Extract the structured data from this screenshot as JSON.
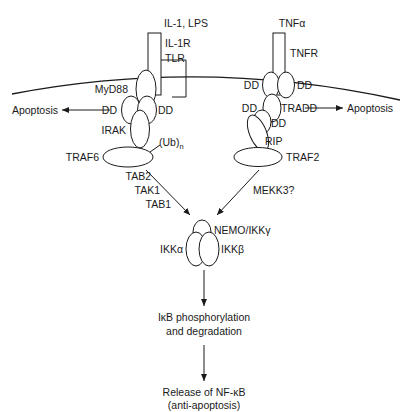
{
  "diagram": {
    "background_color": "#ffffff",
    "stroke_color": "#1a1a1a",
    "ligands": {
      "left": "IL-1, LPS",
      "right": "TNFα"
    },
    "receptors": {
      "left_line1": "IL-1R",
      "left_line2": "TLR",
      "right": "TNFR"
    },
    "left_branch": {
      "adaptor": "MyD88",
      "death_domain_left": "DD",
      "death_domain_right": "DD",
      "kinase": "IRAK",
      "traf": "TRAF6",
      "ubiquitin": "(Ub)",
      "ubiquitin_sub": "n",
      "outcome": "Apoptosis",
      "intermediates": [
        "TAB2",
        "TAK1",
        "TAB1"
      ]
    },
    "right_branch": {
      "death_domain_upper_left": "DD",
      "death_domain_upper_right": "DD",
      "death_domain_lower_left": "DD",
      "adaptor": "TRADD",
      "death_domain_rip": "DD",
      "kinase": "RIP",
      "traf": "TRAF2",
      "outcome": "Apoptosis",
      "intermediates": [
        "MEKK3?"
      ]
    },
    "ikk_complex": {
      "nemo": "NEMO/IKKγ",
      "alpha": "IKKα",
      "beta": "IKKβ"
    },
    "downstream": {
      "step1_line1": "IκB phosphorylation",
      "step1_line2": "and degradation",
      "step2_line1": "Release of NF-κB",
      "step2_line2": "(anti-apoptosis)"
    }
  }
}
